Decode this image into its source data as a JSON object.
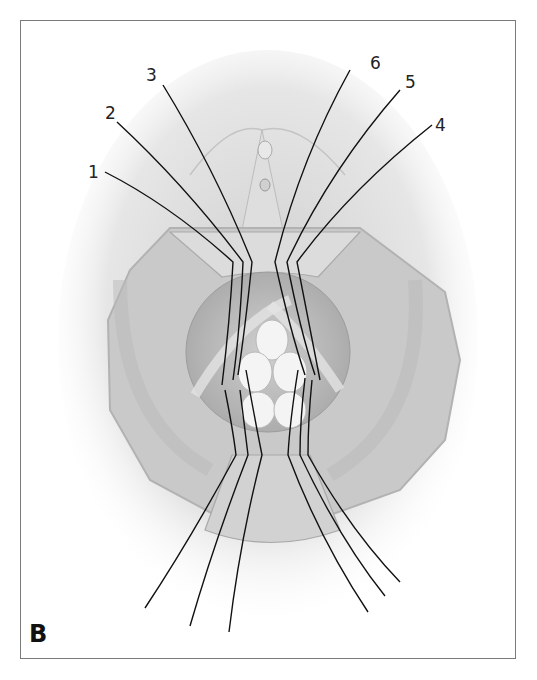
{
  "figure": {
    "panel_letter": "B",
    "suture_labels": [
      {
        "id": 1,
        "text": "1"
      },
      {
        "id": 2,
        "text": "2"
      },
      {
        "id": 3,
        "text": "3"
      },
      {
        "id": 4,
        "text": "4"
      },
      {
        "id": 5,
        "text": "5"
      },
      {
        "id": 6,
        "text": "6"
      }
    ],
    "colors": {
      "frame": "#7a7a7a",
      "tissue": "#c8c8c8",
      "tissue_light": "#e2e2e2",
      "suture": "#111111",
      "background": "#ffffff"
    }
  }
}
